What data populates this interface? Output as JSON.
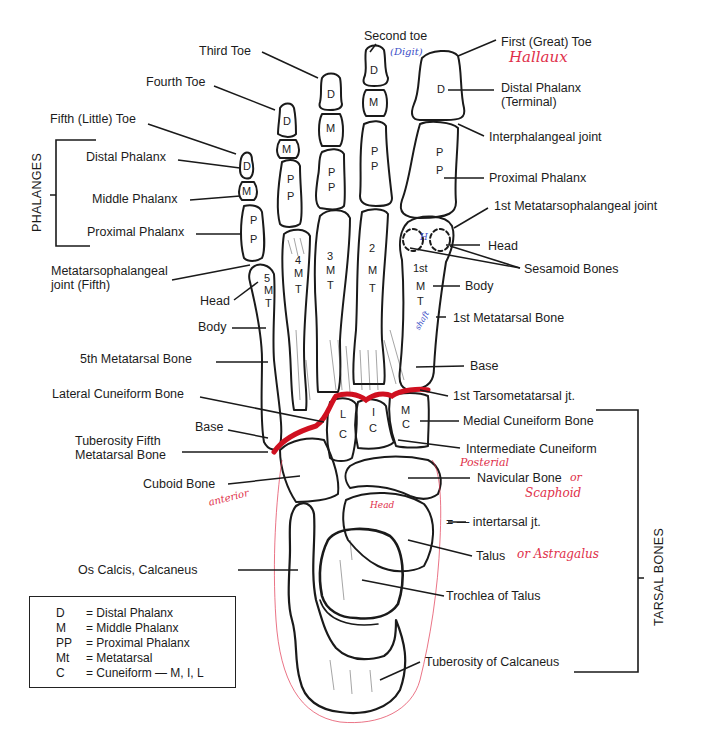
{
  "diagram": {
    "group_labels": {
      "phalanges": "PHALANGES",
      "tarsal_bones": "TARSAL BONES"
    },
    "labels_left": {
      "third_toe": "Third Toe",
      "fourth_toe": "Fourth Toe",
      "fifth_toe": "Fifth (Little) Toe",
      "distal_phalanx": "Distal Phalanx",
      "middle_phalanx": "Middle Phalanx",
      "proximal_phalanx": "Proximal Phalanx",
      "mtp_joint_fifth_1": "Metatarsophalangeal",
      "mtp_joint_fifth_2": "joint (Fifth)",
      "head": "Head",
      "body": "Body",
      "fifth_metatarsal": "5th Metatarsal Bone",
      "lateral_cuneiform": "Lateral Cuneiform Bone",
      "base": "Base",
      "tuberosity_fifth_1": "Tuberosity Fifth",
      "tuberosity_fifth_2": "Metatarsal Bone",
      "cuboid": "Cuboid Bone",
      "os_calcis": "Os Calcis, Calcaneus"
    },
    "labels_right": {
      "second_toe": "Second toe",
      "first_toe": "First (Great) Toe",
      "distal_phalanx_1": "Distal Phalanx",
      "distal_phalanx_2": "(Terminal)",
      "interphalangeal": "Interphalangeal joint",
      "proximal_phalanx": "Proximal Phalanx",
      "first_mtp_joint": "1st Metatarsophalangeal joint",
      "head": "Head",
      "sesamoid": "Sesamoid Bones",
      "body": "Body",
      "first_metatarsal": "1st Metatarsal Bone",
      "base": "Base",
      "first_tmt_joint": "1st Tarsometatarsal jt.",
      "medial_cuneiform": "Medial Cuneiform Bone",
      "intermediate_cuneiform": "Intermediate Cuneiform",
      "navicular": "Navicular Bone",
      "intertarsal": "= — intertarsal jt.",
      "talus": "Talus",
      "trochlea": "Trochlea of Talus",
      "tuberosity_calcaneus": "Tuberosity of Calcaneus"
    },
    "handwritten": {
      "hallaux": "Hallaux",
      "digit": "(Digit)",
      "shaft": "shaft",
      "posterial": "Posterial",
      "or_scaphoid_1": "or",
      "or_scaphoid_2": "Scaphoid",
      "or_astragalus": "or Astragalus",
      "anterior": "anterior",
      "head_talus": "Head",
      "h_mark": "H",
      "red_color": "#e0304a",
      "blue_color": "#3c4fc8"
    },
    "bone_letters": {
      "d": "D",
      "m": "M",
      "p": "P",
      "t": "T",
      "l": "L",
      "c": "C",
      "i": "I",
      "num5": "5",
      "num4": "4",
      "num3": "3",
      "num2": "2",
      "first": "1st"
    }
  },
  "legend": {
    "rows": [
      {
        "abbr": "D",
        "meaning": "= Distal Phalanx"
      },
      {
        "abbr": "M",
        "meaning": "= Middle Phalanx"
      },
      {
        "abbr": "PP",
        "meaning": "= Proximal Phalanx"
      },
      {
        "abbr": "Mt",
        "meaning": "= Metatarsal"
      },
      {
        "abbr": "C",
        "meaning": "= Cuneiform — M, I, L"
      }
    ]
  }
}
